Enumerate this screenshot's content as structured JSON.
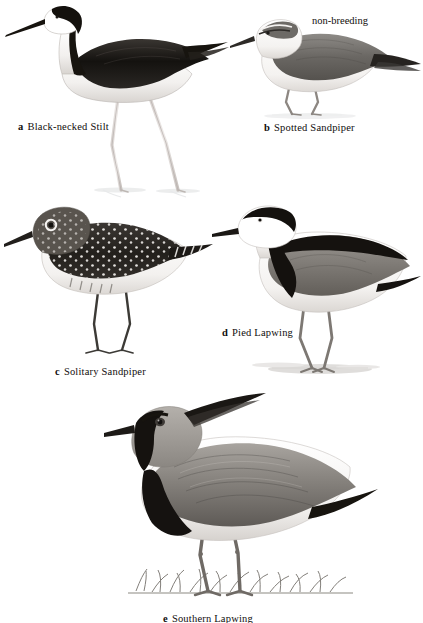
{
  "plate": {
    "background_color": "#ffffff",
    "width": 423,
    "height": 623,
    "style": "grayscale field-guide illustration plate",
    "ink_color": "#100d0c"
  },
  "figures": [
    {
      "letter": "a",
      "name": "Black-necked Stilt",
      "caption_letter": "a",
      "caption_name": "Black-necked Stilt",
      "position": "top-left",
      "pose": "standing in shallow water, walking left",
      "plumage": "black crown and nape, white forehead patch, white face and underparts, black back and wings, very long pink legs, long thin black bill",
      "substrate": "shallow water with faint reflection"
    },
    {
      "letter": "b",
      "name": "Spotted Sandpiper",
      "caption_letter": "b",
      "caption_name": "Spotted Sandpiper",
      "position": "top-right",
      "pose": "crouched, facing left",
      "plumage": "plain grey-brown upperparts, white underparts, white supercilium, dark eyeline, pale legs",
      "substrate": "faint ground shadow",
      "annotation": "non-breeding"
    },
    {
      "letter": "c",
      "name": "Solitary Sandpiper",
      "caption_letter": "c",
      "caption_name": "Solitary Sandpiper",
      "position": "middle-left",
      "pose": "standing, facing left",
      "plumage": "dark brown upperparts heavily spotted white, bold white eye-ring, white underparts, dark greenish legs",
      "substrate": "none"
    },
    {
      "letter": "d",
      "name": "Pied Lapwing",
      "caption_letter": "d",
      "caption_name": "Pied Lapwing",
      "position": "middle-right",
      "pose": "standing alert, facing left",
      "plumage": "black crown stripe, white face, black hindneck and breast band, grey-brown wing with black bar, white underparts, dark bill",
      "substrate": "sandy ground"
    },
    {
      "letter": "e",
      "name": "Southern Lapwing",
      "caption_letter": "e",
      "caption_name": "Southern Lapwing",
      "position": "bottom-centre",
      "pose": "standing, facing left",
      "plumage": "grey-brown head with long pointed black crest, black face stripe and throat, black breast, grey-brown wings, pinkish legs",
      "substrate": "grass tuft"
    }
  ],
  "annotations": [
    {
      "text": "non-breeding",
      "refers_to": "Spotted Sandpiper"
    }
  ]
}
